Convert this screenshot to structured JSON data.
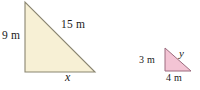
{
  "figure": {
    "background_color": "#ffffff",
    "triangles": [
      {
        "name": "large-triangle",
        "fill_color": "#f7f0d5",
        "stroke_color": "#8a8570",
        "vertices": {
          "apex": [
            25,
            2
          ],
          "bottom_left": [
            25,
            72
          ],
          "bottom_right": [
            95,
            72
          ]
        },
        "labels": {
          "vertical_leg": "9 m",
          "hypotenuse": "15 m",
          "base": "x"
        }
      },
      {
        "name": "small-triangle",
        "fill_color": "#f3c4d4",
        "stroke_color": "#9c6b7e",
        "vertices": {
          "apex": [
            165,
            48
          ],
          "bottom_left": [
            165,
            71
          ],
          "bottom_right": [
            191,
            71
          ]
        },
        "labels": {
          "vertical_leg": "3 m",
          "hypotenuse": "y",
          "base": "4 m"
        }
      }
    ]
  }
}
